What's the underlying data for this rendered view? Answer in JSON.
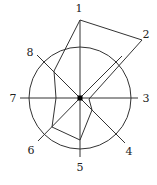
{
  "diagram": {
    "type": "radar",
    "center": [
      80,
      98
    ],
    "circle_radius": 51,
    "stroke_color": "#333333",
    "axes": [
      {
        "label": "1",
        "end": [
          80,
          20
        ],
        "label_pos": [
          79,
          12
        ]
      },
      {
        "label": "2",
        "end": [
          122,
          56
        ],
        "label_pos": [
          146,
          38
        ]
      },
      {
        "label": "3",
        "end": [
          138,
          98
        ],
        "label_pos": [
          146,
          102
        ]
      },
      {
        "label": "4",
        "end": [
          125,
          143
        ],
        "label_pos": [
          129,
          155
        ]
      },
      {
        "label": "5",
        "end": [
          80,
          157
        ],
        "label_pos": [
          80,
          171
        ]
      },
      {
        "label": "6",
        "end": [
          38,
          141
        ],
        "label_pos": [
          31,
          154
        ]
      },
      {
        "label": "7",
        "end": [
          20,
          98
        ],
        "label_pos": [
          13,
          102
        ]
      },
      {
        "label": "8",
        "end": [
          37,
          55
        ],
        "label_pos": [
          30,
          56
        ]
      }
    ],
    "polygon": [
      [
        80,
        20
      ],
      [
        142,
        40
      ],
      [
        89,
        99
      ],
      [
        92,
        110
      ],
      [
        80,
        140
      ],
      [
        52,
        127
      ],
      [
        56,
        98
      ],
      [
        54,
        71
      ]
    ]
  }
}
